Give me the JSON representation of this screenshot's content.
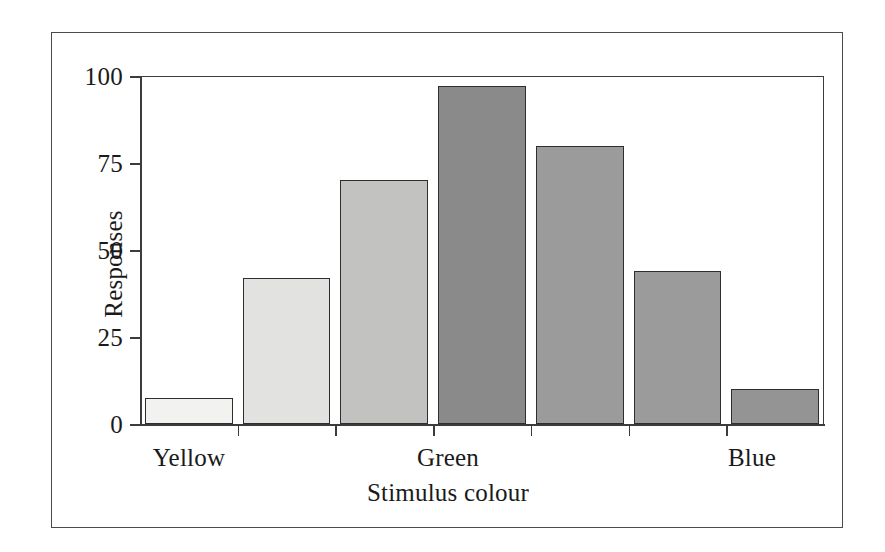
{
  "chart_data": {
    "type": "bar",
    "title": "",
    "xlabel": "Stimulus colour",
    "ylabel": "Responses",
    "ylim": [
      0,
      100
    ],
    "yticks": [
      0,
      25,
      50,
      75,
      100
    ],
    "ytick_labels": [
      "0",
      "25",
      "50",
      "75",
      "100"
    ],
    "grid": false,
    "legend": "none",
    "categories": [
      "Yellow",
      "",
      "",
      "Green",
      "",
      "",
      "Blue"
    ],
    "category_labels_shown": [
      "Yellow",
      "Green",
      "Blue"
    ],
    "values": [
      7.5,
      42,
      70,
      97,
      80,
      44,
      10
    ],
    "bar_colors": [
      "#f2f2f0",
      "#e2e2e0",
      "#c2c2c0",
      "#8a8a8a",
      "#9b9b9b",
      "#9b9b9b",
      "#949494"
    ],
    "bar_edge_color": "#2e2e2e",
    "axis_color": "#3c3c3c",
    "frame_color": "#4a4a4a",
    "background": "#ffffff",
    "bars": [
      {
        "index": 0,
        "label": "Yellow",
        "value": 7.5,
        "color": "#f2f2f0"
      },
      {
        "index": 1,
        "label": "",
        "value": 42,
        "color": "#e2e2e0"
      },
      {
        "index": 2,
        "label": "",
        "value": 70,
        "color": "#c2c2c0"
      },
      {
        "index": 3,
        "label": "Green",
        "value": 97,
        "color": "#8a8a8a"
      },
      {
        "index": 4,
        "label": "",
        "value": 80,
        "color": "#9b9b9b"
      },
      {
        "index": 5,
        "label": "",
        "value": 44,
        "color": "#9b9b9b"
      },
      {
        "index": 6,
        "label": "Blue",
        "value": 10,
        "color": "#949494"
      }
    ]
  },
  "axis": {
    "y_title": "Responses",
    "x_title": "Stimulus colour",
    "y_ticks": [
      "100",
      "75",
      "50",
      "25",
      "0"
    ],
    "x_labels": [
      "Yellow",
      "Green",
      "Blue"
    ]
  }
}
